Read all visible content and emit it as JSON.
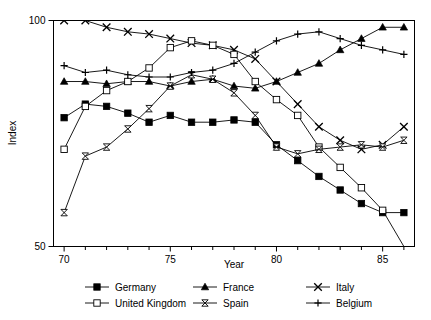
{
  "chart_data": {
    "type": "line",
    "title": "",
    "xlabel": "Year",
    "ylabel": "Index",
    "xlim": [
      69.5,
      86.5
    ],
    "ylim": [
      50,
      100
    ],
    "grid": false,
    "legend_position": "bottom",
    "x": [
      70,
      71,
      72,
      73,
      74,
      75,
      76,
      77,
      78,
      79,
      80,
      81,
      82,
      83,
      84,
      85,
      86
    ],
    "xticks_major": [
      70,
      75,
      80,
      85
    ],
    "xticks_major_labels": [
      "70",
      "75",
      "80",
      "85"
    ],
    "xticks_minor": [
      71,
      72,
      73,
      74,
      76,
      77,
      78,
      79,
      81,
      82,
      83,
      84,
      86
    ],
    "yticks_major": [
      50,
      100
    ],
    "yticks_major_labels": [
      "50",
      "100"
    ],
    "series": [
      {
        "name": "Germany",
        "marker": "filled-square",
        "values": [
          78.5,
          81.5,
          81.0,
          79.5,
          77.5,
          79.0,
          77.5,
          77.5,
          78.0,
          77.5,
          72.5,
          69.0,
          65.5,
          62.5,
          59.5,
          57.5,
          57.5
        ]
      },
      {
        "name": "France",
        "marker": "filled-triangle",
        "values": [
          86.5,
          86.5,
          86.0,
          86.5,
          86.5,
          85.5,
          86.5,
          87.0,
          85.5,
          85.0,
          86.5,
          88.5,
          90.5,
          93.5,
          96.0,
          98.5,
          98.5
        ]
      },
      {
        "name": "Italy",
        "marker": "x",
        "values": [
          100.0,
          100.0,
          98.5,
          97.5,
          97.0,
          96.0,
          95.0,
          94.5,
          93.5,
          91.5,
          86.5,
          81.5,
          76.5,
          73.5,
          71.5,
          72.5,
          76.5
        ]
      },
      {
        "name": "United Kingdom",
        "marker": "open-square",
        "values": [
          71.5,
          81.0,
          84.5,
          86.5,
          89.5,
          94.0,
          95.5,
          94.5,
          92.5,
          86.5,
          82.5,
          79.0,
          72.0,
          67.5,
          63.0,
          58.0,
          50.0
        ]
      },
      {
        "name": "Spain",
        "marker": "bowtie",
        "values": [
          57.5,
          70.0,
          72.0,
          76.0,
          80.5,
          85.5,
          88.0,
          87.0,
          84.0,
          79.0,
          72.0,
          70.5,
          71.5,
          72.0,
          72.5,
          72.0,
          73.5
        ]
      },
      {
        "name": "Belgium",
        "marker": "plus",
        "values": [
          90.0,
          88.5,
          89.0,
          88.0,
          87.5,
          87.5,
          88.5,
          89.0,
          90.5,
          93.0,
          95.5,
          97.0,
          97.5,
          96.0,
          94.5,
          93.5,
          92.5
        ]
      }
    ]
  },
  "axes": {
    "y_label": "Index",
    "x_label": "Year",
    "y_top_label": "100",
    "y_bottom_label": "50",
    "x_tick_labels": [
      "70",
      "75",
      "80",
      "85"
    ]
  },
  "legend": {
    "entries": [
      {
        "label": "Germany",
        "marker": "filled-square"
      },
      {
        "label": "France",
        "marker": "filled-triangle"
      },
      {
        "label": "Italy",
        "marker": "x"
      },
      {
        "label": "United Kingdom",
        "marker": "open-square"
      },
      {
        "label": "Spain",
        "marker": "bowtie"
      },
      {
        "label": "Belgium",
        "marker": "plus"
      }
    ]
  },
  "colors": {
    "ink": "#000000",
    "background": "#ffffff"
  }
}
